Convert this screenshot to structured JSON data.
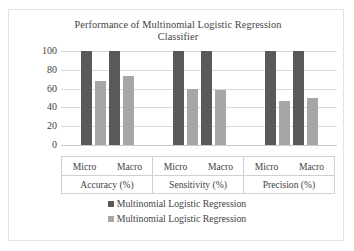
{
  "chart_data": {
    "type": "bar",
    "title": "Performance of Multinomial Logistic Regression Classifier",
    "title_line1": "Performance of Multinomial Logistic Regression",
    "title_line2": "Classifier",
    "xlabel": "",
    "ylabel": "",
    "ylim": [
      0,
      100
    ],
    "yticks": [
      100,
      80,
      60,
      40,
      20,
      0
    ],
    "grid": true,
    "legend_position": "bottom",
    "categories": [
      "Micro",
      "Macro",
      "Micro",
      "Macro",
      "Micro",
      "Macro"
    ],
    "group_labels": [
      "Accuracy (%)",
      "Sensitivity (%)",
      "Precision (%)"
    ],
    "groups": [
      {
        "label": "Accuracy (%)",
        "subcategories": [
          "Micro",
          "Macro"
        ],
        "bars": [
          {
            "sub": "Micro",
            "series": 0,
            "value": 100
          },
          {
            "sub": "Micro",
            "series": 1,
            "value": 68
          },
          {
            "sub": "Macro",
            "series": 0,
            "value": 100
          },
          {
            "sub": "Macro",
            "series": 1,
            "value": 73
          }
        ]
      },
      {
        "label": "Sensitivity (%)",
        "subcategories": [
          "Micro",
          "Macro"
        ],
        "bars": [
          {
            "sub": "Micro",
            "series": 0,
            "value": 100
          },
          {
            "sub": "Micro",
            "series": 1,
            "value": 60
          },
          {
            "sub": "Macro",
            "series": 0,
            "value": 100
          },
          {
            "sub": "Macro",
            "series": 1,
            "value": 59
          }
        ]
      },
      {
        "label": "Precision (%)",
        "subcategories": [
          "Micro",
          "Macro"
        ],
        "bars": [
          {
            "sub": "Micro",
            "series": 0,
            "value": 100
          },
          {
            "sub": "Micro",
            "series": 1,
            "value": 47
          },
          {
            "sub": "Macro",
            "series": 0,
            "value": 100
          },
          {
            "sub": "Macro",
            "series": 1,
            "value": 50
          }
        ]
      }
    ],
    "series": [
      {
        "name": "Multinomial Logistic Regression",
        "color": "#595959",
        "values": [
          100,
          100,
          100,
          100,
          100,
          100
        ]
      },
      {
        "name": "Multinomial Logistic Regression",
        "color": "#a6a6a6",
        "values": [
          68,
          73,
          60,
          59,
          47,
          50
        ]
      }
    ],
    "legend": [
      {
        "label": "Multinomial Logistic Regression",
        "color": "#595959"
      },
      {
        "label": "Multinomial Logistic Regression",
        "color": "#a6a6a6"
      }
    ]
  },
  "colors": {
    "series_dark": "#595959",
    "series_light": "#a6a6a6",
    "gridline": "#d9d9d9",
    "border": "#e2e2e2",
    "text": "#3f3f3f",
    "background": "#ffffff"
  }
}
